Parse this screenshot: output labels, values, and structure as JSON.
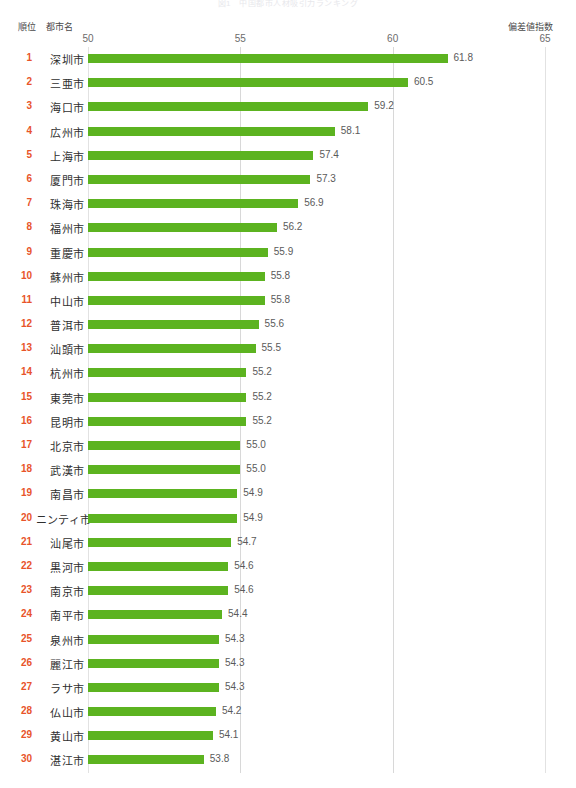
{
  "title": "図1　中国都市人材吸引力ランキング",
  "header": {
    "rank_label": "順位",
    "city_label": "都市名",
    "index_label": "偏差値指数"
  },
  "axis": {
    "ticks": [
      50,
      55,
      60,
      65
    ],
    "tick_labels": [
      "50",
      "55",
      "60",
      "65"
    ]
  },
  "colors": {
    "bar": "#5cb320",
    "rank": "#e8542a",
    "gridline": "#d8d8d8",
    "text": "#3c3c3c"
  },
  "chart_data": {
    "type": "bar",
    "orientation": "horizontal",
    "title": "図1　中国都市人材吸引力ランキング",
    "xlabel": "偏差値指数",
    "ylabel": "都市名",
    "xlim": [
      50,
      65
    ],
    "grid": true,
    "legend": "none",
    "categories": [
      "深圳市",
      "三亜市",
      "海口市",
      "広州市",
      "上海市",
      "厦門市",
      "珠海市",
      "福州市",
      "重慶市",
      "蘇州市",
      "中山市",
      "普洱市",
      "汕頭市",
      "杭州市",
      "東莞市",
      "昆明市",
      "北京市",
      "武漢市",
      "南昌市",
      "ニンティ市",
      "汕尾市",
      "黒河市",
      "南京市",
      "南平市",
      "泉州市",
      "麗江市",
      "ラサ市",
      "仏山市",
      "黄山市",
      "湛江市"
    ],
    "values": [
      61.8,
      60.5,
      59.2,
      58.1,
      57.4,
      57.3,
      56.9,
      56.2,
      55.9,
      55.8,
      55.8,
      55.6,
      55.5,
      55.2,
      55.2,
      55.2,
      55.0,
      55.0,
      54.9,
      54.9,
      54.7,
      54.6,
      54.6,
      54.4,
      54.3,
      54.3,
      54.3,
      54.2,
      54.1,
      53.8
    ],
    "ranks": [
      1,
      2,
      3,
      4,
      5,
      6,
      7,
      8,
      9,
      10,
      11,
      12,
      13,
      14,
      15,
      16,
      17,
      18,
      19,
      20,
      21,
      22,
      23,
      24,
      25,
      26,
      27,
      28,
      29,
      30
    ],
    "value_labels": [
      "61.8",
      "60.5",
      "59.2",
      "58.1",
      "57.4",
      "57.3",
      "56.9",
      "56.2",
      "55.9",
      "55.8",
      "55.8",
      "55.6",
      "55.5",
      "55.2",
      "55.2",
      "55.2",
      "55.0",
      "55.0",
      "54.9",
      "54.9",
      "54.7",
      "54.6",
      "54.6",
      "54.4",
      "54.3",
      "54.3",
      "54.3",
      "54.2",
      "54.1",
      "53.8"
    ]
  }
}
